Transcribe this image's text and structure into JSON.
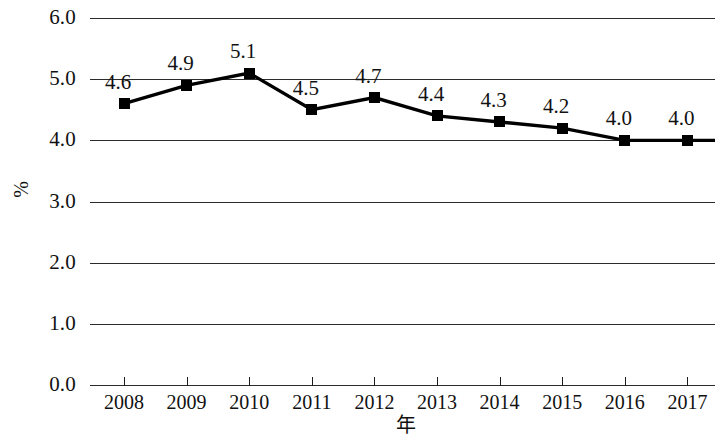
{
  "chart_data": {
    "type": "line",
    "title": "",
    "subtitle": "",
    "xlabel": "年",
    "ylabel": "%",
    "categories": [
      "2008",
      "2009",
      "2010",
      "2011",
      "2012",
      "2013",
      "2014",
      "2015",
      "2016",
      "2017"
    ],
    "values": [
      4.6,
      4.9,
      5.1,
      4.5,
      4.7,
      4.4,
      4.3,
      4.2,
      4.0,
      4.0
    ],
    "point_labels": [
      "4.6",
      "4.9",
      "5.1",
      "4.5",
      "4.7",
      "4.4",
      "4.3",
      "4.2",
      "4.0",
      "4.0"
    ],
    "ylim": [
      0.0,
      6.0
    ],
    "y_ticks": [
      0.0,
      1.0,
      2.0,
      3.0,
      4.0,
      5.0,
      6.0
    ],
    "y_tick_labels": [
      "0.0",
      "1.0",
      "2.0",
      "3.0",
      "4.0",
      "5.0",
      "6.0"
    ],
    "grid": true,
    "grid_axis": "y",
    "legend": false,
    "legend_position": "none",
    "marker": "square",
    "line_color": "#000000",
    "marker_color": "#000000",
    "grid_color": "#2b2b2b",
    "background_color": "#ffffff"
  }
}
